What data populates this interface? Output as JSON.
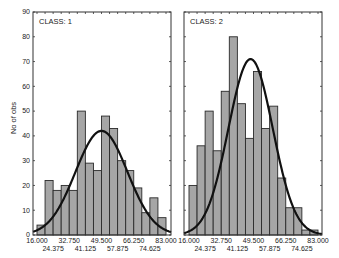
{
  "chart_data": [
    {
      "type": "bar",
      "title": "CLASS: 1",
      "xlabel": "",
      "ylabel": "No of obs",
      "ylim": [
        0,
        90
      ],
      "xlim": [
        16.0,
        83.0
      ],
      "yticks": [
        0,
        10,
        20,
        30,
        40,
        50,
        60,
        70,
        80,
        90
      ],
      "xticks_upper": [
        "16.000",
        "32.750",
        "49.500",
        "66.250",
        "83.000"
      ],
      "xticks_lower": [
        "24.375",
        "41.125",
        "57.875",
        "74.625"
      ],
      "bin_width": 4.1875,
      "categories": [
        "16.00-20.19",
        "20.19-24.38",
        "24.38-28.56",
        "28.56-32.75",
        "32.75-36.94",
        "36.94-41.13",
        "41.13-45.31",
        "45.31-49.50",
        "49.50-53.69",
        "53.69-57.88",
        "57.88-62.06",
        "62.06-66.25",
        "66.25-70.44",
        "70.44-74.63",
        "74.63-78.81",
        "78.81-83.00"
      ],
      "values": [
        4,
        22,
        18,
        20,
        18,
        50,
        29,
        26,
        48,
        43,
        30,
        26,
        19,
        9,
        15,
        7
      ],
      "fitted_curve": {
        "type": "normal",
        "mean": 49.5,
        "sd": 13.5,
        "peak": 42
      },
      "grid": false
    },
    {
      "type": "bar",
      "title": "CLASS: 2",
      "xlabel": "",
      "ylabel": "No of obs",
      "ylim": [
        0,
        90
      ],
      "xlim": [
        16.0,
        83.0
      ],
      "yticks": [
        0,
        10,
        20,
        30,
        40,
        50,
        60,
        70,
        80,
        90
      ],
      "xticks_upper": [
        "16.000",
        "32.750",
        "49.500",
        "66.250",
        "83.000"
      ],
      "xticks_lower": [
        "24.375",
        "41.125",
        "57.875",
        "74.625"
      ],
      "bin_width": 4.1875,
      "categories": [
        "16.00-20.19",
        "20.19-24.38",
        "24.38-28.56",
        "28.56-32.75",
        "32.75-36.94",
        "36.94-41.13",
        "41.13-45.31",
        "45.31-49.50",
        "49.50-53.69",
        "53.69-57.88",
        "57.88-62.06",
        "62.06-66.25",
        "66.25-70.44",
        "70.44-74.63",
        "74.63-78.81",
        "78.81-83.00"
      ],
      "values": [
        20,
        36,
        50,
        34,
        58,
        80,
        53,
        39,
        66,
        43,
        52,
        23,
        11,
        11,
        2,
        2
      ],
      "fitted_curve": {
        "type": "normal",
        "mean": 48.0,
        "sd": 11.5,
        "peak": 71
      },
      "grid": false
    }
  ],
  "panels": [
    {
      "title": "CLASS: 1"
    },
    {
      "title": "CLASS: 2"
    }
  ],
  "y_axis_label": "No of obs",
  "colors": {
    "bar_fill": "#a6a6a6",
    "bar_stroke": "#2a2a2a",
    "curve": "#111111",
    "axis": "#333333"
  }
}
